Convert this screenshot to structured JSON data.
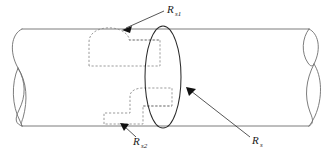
{
  "figure": {
    "background_color": "#ffffff",
    "width": 330,
    "height": 151
  },
  "geometry": {
    "cylinder": {
      "name": "cylinder-body",
      "top_edge_y": 29,
      "bottom_edge_y": 126,
      "left_break_x": 22,
      "right_break_x": 309,
      "line_color": "#6e6e6e",
      "line_width": 0.9
    },
    "cross_section_ellipse": {
      "name": "cross-section-ellipse",
      "center_x": 163,
      "center_y": 77,
      "radius_x": 18,
      "radius_y": 51,
      "line_color": "#2b2b2b"
    },
    "patch_upper": {
      "name": "dashed-patch-upper",
      "line_color": "#8a8a8a",
      "dash_pattern": "2.2 1.8"
    },
    "patch_lower": {
      "name": "dashed-patch-lower",
      "line_color": "#8a8a8a",
      "dash_pattern": "2.2 1.8"
    }
  },
  "labels": {
    "upper_patch": {
      "base": "R",
      "subscript": "s1",
      "full": "Rs1",
      "x": 167,
      "y": 13
    },
    "lower_patch": {
      "base": "R",
      "subscript": "s2",
      "full": "Rs2",
      "x": 133,
      "y": 145
    },
    "cross_section": {
      "base": "R",
      "subscript": "s",
      "full": "Rs",
      "x": 252,
      "y": 144
    }
  },
  "leaders": [
    {
      "name": "leader-upper-patch",
      "from_label": "Rs1",
      "start_x": 164,
      "start_y": 11,
      "end_x": 123,
      "end_y": 30,
      "arrow_at": "end"
    },
    {
      "name": "leader-lower-patch",
      "from_label": "Rs2",
      "start_x": 136,
      "start_y": 137,
      "end_x": 122,
      "end_y": 124,
      "arrow_at": "end"
    },
    {
      "name": "leader-cross-section",
      "from_label": "Rs",
      "start_x": 250,
      "start_y": 137,
      "end_x": 188,
      "end_y": 88,
      "arrow_at": "end"
    }
  ]
}
